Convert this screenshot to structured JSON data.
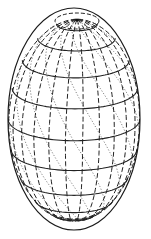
{
  "figure": {
    "type": "ellipsoid-wireframe",
    "colors": {
      "background": "#ffffff",
      "lines": "#222222",
      "helix": "#777777"
    },
    "outline": {
      "cx": 74,
      "cy": 119,
      "rx": 66,
      "ry": 111
    },
    "pole": {
      "x": 77,
      "y": 20
    },
    "latitude_count": 9,
    "meridian_count": 12,
    "helix_count": 10
  }
}
